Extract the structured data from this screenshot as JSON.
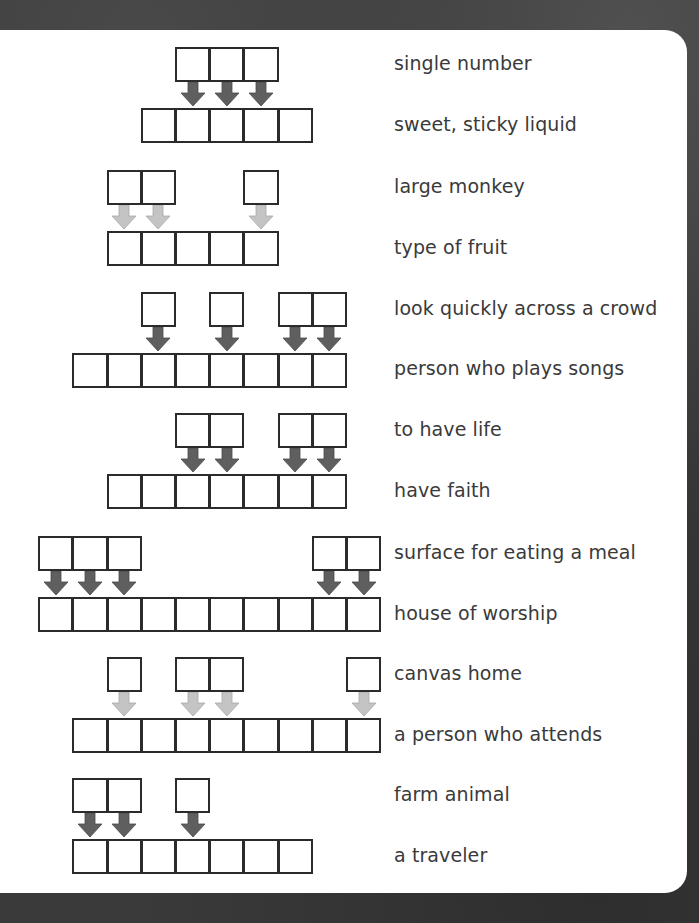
{
  "colors": {
    "arrow_dark": "#5f5f5f",
    "arrow_light": "#c4c4c4",
    "box_border": "#2b2b2b",
    "panel": "#ffffff",
    "background": "#3a3a3a"
  },
  "puzzles": [
    {
      "short_clue": "single number",
      "long_clue": "sweet, sticky liquid",
      "arrow_shade": "dark",
      "top_cols": [
        5,
        6,
        7
      ],
      "bottom_cols": [
        4,
        8
      ]
    },
    {
      "short_clue": "large monkey",
      "long_clue": "type of fruit",
      "arrow_shade": "light",
      "top_cols": [
        3,
        4,
        7
      ],
      "bottom_cols": [
        3,
        7
      ]
    },
    {
      "short_clue": "look quickly across a crowd",
      "long_clue": "person who plays songs",
      "arrow_shade": "dark",
      "top_cols": [
        4,
        6,
        8,
        9
      ],
      "bottom_cols": [
        2,
        9
      ]
    },
    {
      "short_clue": "to have life",
      "long_clue": "have faith",
      "arrow_shade": "dark",
      "top_cols": [
        5,
        6,
        8,
        9
      ],
      "bottom_cols": [
        3,
        9
      ]
    },
    {
      "short_clue": "surface for eating a meal",
      "long_clue": "house of worship",
      "arrow_shade": "dark",
      "top_cols": [
        1,
        2,
        3,
        9,
        10
      ],
      "bottom_cols": [
        1,
        10
      ]
    },
    {
      "short_clue": "canvas home",
      "long_clue": "a person who attends",
      "arrow_shade": "light",
      "top_cols": [
        3,
        5,
        6,
        10
      ],
      "bottom_cols": [
        2,
        10
      ]
    },
    {
      "short_clue": "farm animal",
      "long_clue": "a traveler",
      "arrow_shade": "dark",
      "top_cols": [
        2,
        3,
        5
      ],
      "bottom_cols": [
        2,
        8
      ]
    }
  ],
  "layout": {
    "col_origin": 4,
    "col_step": 34.2,
    "row_tops": [
      47,
      170,
      292,
      413,
      536,
      657,
      778
    ],
    "bottom_offset": 61,
    "short_clue_y": [
      52,
      175,
      297,
      418,
      541,
      662,
      783
    ],
    "long_clue_y": [
      113,
      236,
      357,
      479,
      602,
      723,
      844
    ]
  }
}
